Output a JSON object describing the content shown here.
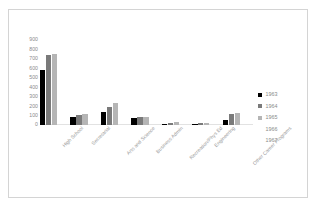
{
  "chart_data": {
    "type": "bar",
    "title": "",
    "subtitle": "",
    "xlabel": "",
    "ylabel": "",
    "ylim": [
      0,
      900
    ],
    "y_ticks": [
      900,
      800,
      700,
      600,
      500,
      400,
      300,
      200,
      100,
      0
    ],
    "grid": false,
    "legend_position": "right",
    "categories": [
      "High School",
      "Secretarial",
      "Arts and Science",
      "Business Admin",
      "Recreation/Phys Ed",
      "Engineering",
      "Other Career Programs"
    ],
    "series": [
      {
        "name": "1963",
        "color": "#000000",
        "values": [
          585,
          88,
          135,
          72,
          14,
          10,
          55
        ]
      },
      {
        "name": "1964",
        "color": "#7a7a7a",
        "values": [
          740,
          105,
          190,
          82,
          26,
          20,
          120
        ]
      },
      {
        "name": "1965",
        "color": "#b5b5b5",
        "values": [
          755,
          112,
          232,
          90,
          30,
          24,
          125
        ]
      },
      {
        "name": "1966",
        "color": "#ffffff",
        "values": [
          null,
          null,
          null,
          null,
          null,
          null,
          null
        ]
      },
      {
        "name": "1967",
        "color": "#ffffff",
        "values": [
          null,
          null,
          null,
          null,
          null,
          null,
          null
        ]
      }
    ]
  },
  "legend": {
    "entries": [
      {
        "label": "1963",
        "color": "#000000",
        "swatch_visible": true
      },
      {
        "label": "1964",
        "color": "#7a7a7a",
        "swatch_visible": true
      },
      {
        "label": "1965",
        "color": "#b5b5b5",
        "swatch_visible": true
      },
      {
        "label": "1966",
        "color": "#ffffff",
        "swatch_visible": false
      },
      {
        "label": "1967",
        "color": "#ffffff",
        "swatch_visible": false
      }
    ]
  },
  "style": {
    "plot_background": "#ffffff",
    "frame_border": "#d4d4d4",
    "axis_text": "#8a8a8a",
    "category_text": "#9a9a9a",
    "baseline": "#e2e2e2"
  }
}
